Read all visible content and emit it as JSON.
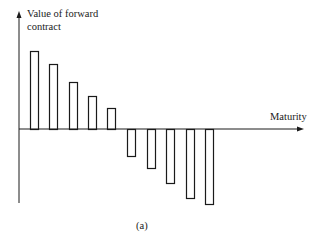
{
  "chart_data": {
    "type": "bar",
    "title": "",
    "caption": "(a)",
    "xlabel": "Maturity",
    "ylabel": "Value of forward contract",
    "ylabel_lines": [
      "Value of forward",
      "contract"
    ],
    "units": "relative (no numeric scale shown)",
    "categories": [
      "1",
      "2",
      "3",
      "4",
      "5",
      "6",
      "7",
      "8",
      "9",
      "10"
    ],
    "values": [
      78,
      65,
      47,
      33,
      21,
      -27,
      -39,
      -54,
      -69,
      -75
    ],
    "ylim": [
      -80,
      90
    ],
    "grid": false,
    "legend": null,
    "bar_style": "outlined, white fill, black stroke",
    "tick_labels_shown": false
  },
  "layout": {
    "baseline_y": 129,
    "axis_x": 19,
    "axis_top": 11,
    "axis_bottom": 203,
    "arrow_x_end": 304,
    "bar_lefts": [
      30,
      49,
      69,
      88,
      107,
      127,
      147,
      166,
      186,
      205
    ],
    "bar_width": 8
  },
  "colors": {
    "stroke": "#1a1a1a",
    "background": "#ffffff"
  }
}
